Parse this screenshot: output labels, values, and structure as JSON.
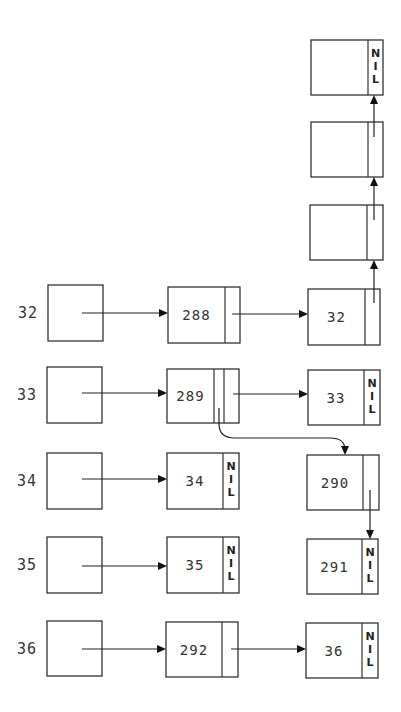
{
  "colors": {
    "stroke": "#333333",
    "background": "#ffffff"
  },
  "rows": [
    {
      "label": "32",
      "bucket": {
        "x": 48,
        "y": 285,
        "w": 55,
        "h": 56
      }
    },
    {
      "label": "33",
      "bucket": {
        "x": 47,
        "y": 367,
        "w": 55,
        "h": 56
      }
    },
    {
      "label": "34",
      "bucket": {
        "x": 47,
        "y": 453,
        "w": 55,
        "h": 56
      }
    },
    {
      "label": "35",
      "bucket": {
        "x": 47,
        "y": 537,
        "w": 55,
        "h": 56
      }
    },
    {
      "label": "36",
      "bucket": {
        "x": 47,
        "y": 621,
        "w": 55,
        "h": 55
      }
    }
  ],
  "nodes": [
    {
      "id": "n288",
      "text": "288",
      "x": 168,
      "y": 287,
      "w": 72,
      "h": 56,
      "dividers": [
        225
      ],
      "nil": false
    },
    {
      "id": "n32",
      "text": "32",
      "x": 308,
      "y": 289,
      "w": 72,
      "h": 56,
      "dividers": [
        365
      ],
      "nil": false
    },
    {
      "id": "t3",
      "text": "",
      "x": 310,
      "y": 205,
      "w": 73,
      "h": 55,
      "dividers": [
        367
      ],
      "nil": false
    },
    {
      "id": "t2",
      "text": "",
      "x": 311,
      "y": 122,
      "w": 72,
      "h": 55,
      "dividers": [
        368
      ],
      "nil": false
    },
    {
      "id": "t1",
      "text": "",
      "x": 311,
      "y": 40,
      "w": 72,
      "h": 55,
      "dividers": [
        368
      ],
      "nil": true
    },
    {
      "id": "n289",
      "text": "289",
      "x": 167,
      "y": 369,
      "w": 72,
      "h": 54,
      "dividers": [
        214,
        224
      ],
      "nil": false
    },
    {
      "id": "n33",
      "text": "33",
      "x": 308,
      "y": 370,
      "w": 72,
      "h": 55,
      "dividers": [
        364
      ],
      "nil": true
    },
    {
      "id": "n34",
      "text": "34",
      "x": 167,
      "y": 453,
      "w": 72,
      "h": 56,
      "dividers": [
        223
      ],
      "nil": true
    },
    {
      "id": "n290",
      "text": "290",
      "x": 307,
      "y": 455,
      "w": 72,
      "h": 55,
      "dividers": [
        363
      ],
      "nil": false
    },
    {
      "id": "n35",
      "text": "35",
      "x": 167,
      "y": 537,
      "w": 72,
      "h": 56,
      "dividers": [
        223
      ],
      "nil": true
    },
    {
      "id": "n291",
      "text": "291",
      "x": 307,
      "y": 539,
      "w": 71,
      "h": 55,
      "dividers": [
        362
      ],
      "nil": true
    },
    {
      "id": "n292",
      "text": "292",
      "x": 166,
      "y": 622,
      "w": 72,
      "h": 55,
      "dividers": [
        222
      ],
      "nil": false
    },
    {
      "id": "n36",
      "text": "36",
      "x": 306,
      "y": 623,
      "w": 72,
      "h": 55,
      "dividers": [
        362
      ],
      "nil": true
    }
  ],
  "nil_text": [
    "N",
    "I",
    "L"
  ],
  "arrows": [
    {
      "type": "h",
      "x1": 82,
      "y1": 313,
      "x2": 168,
      "y2": 313
    },
    {
      "type": "h",
      "x1": 232,
      "y1": 314,
      "x2": 308,
      "y2": 314
    },
    {
      "type": "v",
      "x1": 374,
      "y1": 303,
      "x2": 374,
      "y2": 260
    },
    {
      "type": "v",
      "x1": 374,
      "y1": 220,
      "x2": 374,
      "y2": 177
    },
    {
      "type": "v",
      "x1": 374,
      "y1": 137,
      "x2": 374,
      "y2": 95
    },
    {
      "type": "h",
      "x1": 82,
      "y1": 393,
      "x2": 167,
      "y2": 393
    },
    {
      "type": "h",
      "x1": 233,
      "y1": 394,
      "x2": 308,
      "y2": 394
    },
    {
      "type": "curve",
      "d": "M219 408 L219 424 Q219 438 235 438 L330 438 Q345 438 345 450",
      "x2": 345,
      "y2": 455
    },
    {
      "type": "h",
      "x1": 82,
      "y1": 479,
      "x2": 167,
      "y2": 479
    },
    {
      "type": "v",
      "x1": 370,
      "y1": 490,
      "x2": 370,
      "y2": 539
    },
    {
      "type": "h",
      "x1": 82,
      "y1": 566,
      "x2": 167,
      "y2": 566
    },
    {
      "type": "h",
      "x1": 82,
      "y1": 649,
      "x2": 166,
      "y2": 649
    },
    {
      "type": "h",
      "x1": 231,
      "y1": 649,
      "x2": 306,
      "y2": 649
    }
  ]
}
